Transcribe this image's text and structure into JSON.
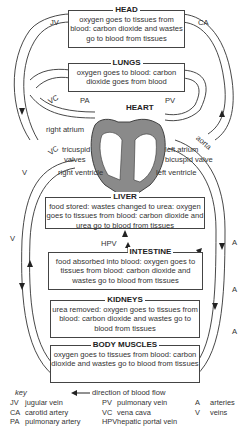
{
  "organs": {
    "head": {
      "title": "HEAD",
      "text": "oxygen goes to tissues from blood: carbon dioxide and wastes go to blood from tissues"
    },
    "lungs": {
      "title": "LUNGS",
      "text": "oxygen goes to blood: carbon dioxide goes from blood"
    },
    "heart": {
      "title": "HEART"
    },
    "liver": {
      "title": "LIVER",
      "text": "food stored: wastes changed to urea: oxygen goes to tissues from blood: carbon dioxide and urea go to blood from tissues"
    },
    "intestine": {
      "title": "INTESTINE",
      "text": "food absorbed into blood: oxygen goes to tissues from blood: carbon dioxide and wastes go to blood from tissues"
    },
    "kidneys": {
      "title": "KIDNEYS",
      "text": "urea removed: oxygen goes to tissues from blood: carbon dioxide and wastes go to blood from tissues"
    },
    "muscles": {
      "title": "BODY MUSCLES",
      "text": "oxygen goes to tissues from blood: carbon dioxide and wastes go to blood from tissues"
    }
  },
  "vessel_labels": {
    "jv": "JV",
    "ca": "CA",
    "vc_top": "VC",
    "pa": "PA",
    "pv": "PV",
    "aorta": "aorta",
    "vc_mid": "VC",
    "v1": "V",
    "v2": "V",
    "hpv": "HPV",
    "a1": "A",
    "a2": "A",
    "a3": "A"
  },
  "heart_labels": {
    "right_atrium": "right atrium",
    "tricuspid": "tricuspid",
    "valves": "valves",
    "right_ventricle": "right ventricle",
    "left_atrium": "left atrium",
    "bicuspid": "bicuspid valve",
    "left_ventricle": "left ventricle"
  },
  "key": {
    "title": "key",
    "flow": "direction of blood flow",
    "items": [
      {
        "abbr": "JV",
        "name": "jugular vein"
      },
      {
        "abbr": "CA",
        "name": "carotid artery"
      },
      {
        "abbr": "PA",
        "name": "pulmonary artery"
      },
      {
        "abbr": "PV",
        "name": "pulmonary vein"
      },
      {
        "abbr": "VC",
        "name": "vena cava"
      },
      {
        "abbr": "HPV",
        "name": "hepatic portal vein"
      },
      {
        "abbr": "A",
        "name": "arteries"
      },
      {
        "abbr": "V",
        "name": "veins"
      }
    ]
  },
  "colors": {
    "heart_fill": "#8a8a8a",
    "line": "#333333"
  }
}
